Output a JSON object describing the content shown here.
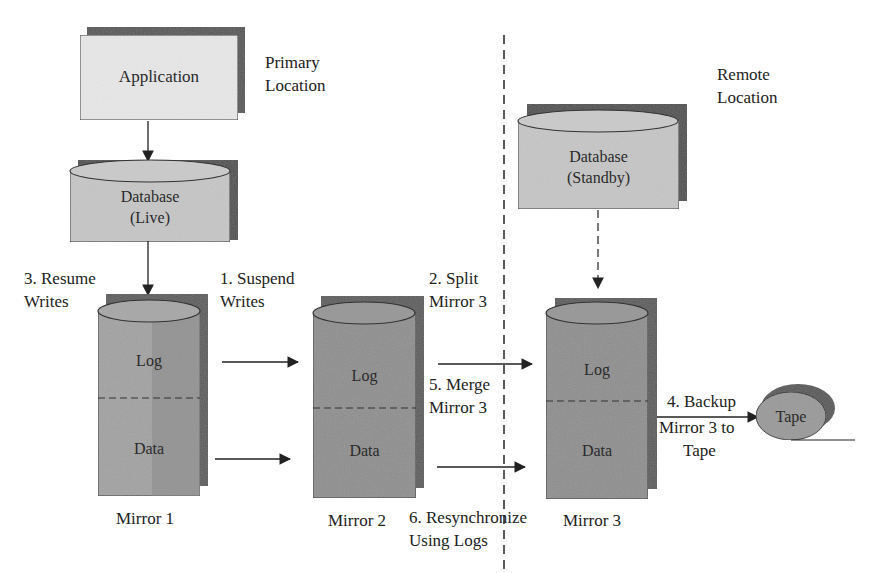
{
  "diagram": {
    "regions": {
      "primary": {
        "line1": "Primary",
        "line2": "Location"
      },
      "remote": {
        "line1": "Remote",
        "line2": "Location"
      }
    },
    "nodes": {
      "application": {
        "label": "Application"
      },
      "db_live": {
        "line1": "Database",
        "line2": "(Live)"
      },
      "db_standby": {
        "line1": "Database",
        "line2": "(Standby)"
      },
      "mirror1": {
        "log": "Log",
        "data": "Data",
        "caption": "Mirror 1"
      },
      "mirror2": {
        "log": "Log",
        "data": "Data",
        "caption": "Mirror 2"
      },
      "mirror3": {
        "log": "Log",
        "data": "Data",
        "caption": "Mirror 3"
      },
      "tape": {
        "label": "Tape"
      }
    },
    "steps": {
      "s1": {
        "line1": "1. Suspend",
        "line2": "Writes"
      },
      "s2": {
        "line1": "2. Split",
        "line2": "Mirror 3"
      },
      "s3": {
        "line1": "3. Resume",
        "line2": "Writes"
      },
      "s4": {
        "line1": "4. Backup",
        "line2": "Mirror 3 to",
        "line3": "Tape"
      },
      "s5": {
        "line1": "5. Merge",
        "line2": "Mirror 3"
      },
      "s6": {
        "line1": "6. Resynchronize",
        "line2": "Using Logs"
      }
    },
    "edges": [
      {
        "from": "application",
        "to": "db_live",
        "style": "solid"
      },
      {
        "from": "db_live",
        "to": "mirror1",
        "style": "solid"
      },
      {
        "from": "mirror1.log",
        "to": "mirror2.log",
        "style": "solid"
      },
      {
        "from": "mirror1.data",
        "to": "mirror2.data",
        "style": "solid"
      },
      {
        "from": "mirror2.log",
        "to": "mirror3.log",
        "style": "solid"
      },
      {
        "from": "mirror2.data",
        "to": "mirror3.data",
        "style": "solid"
      },
      {
        "from": "db_standby",
        "to": "mirror3",
        "style": "dashed"
      },
      {
        "from": "mirror3",
        "to": "tape",
        "style": "solid"
      }
    ],
    "colors": {
      "box_light": "#e6e6e6",
      "cylinder_light": "#c4c4c4",
      "mirror_fill": "#9a9a9a",
      "mirror_dark": "#7c7c7c",
      "shadow": "#5a5a5a",
      "stroke": "#222222"
    }
  }
}
